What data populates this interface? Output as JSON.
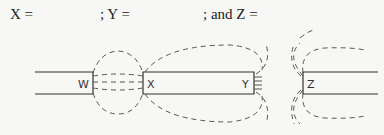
{
  "prompt": {
    "x_label": "X =",
    "y_label": "; Y =",
    "z_label": "; and Z ="
  },
  "diagram": {
    "poles": [
      {
        "label": "W"
      },
      {
        "label": "X"
      },
      {
        "label": "Y"
      },
      {
        "label": "Z"
      }
    ],
    "line_color": "#333333",
    "field_line_color": "#555555"
  }
}
